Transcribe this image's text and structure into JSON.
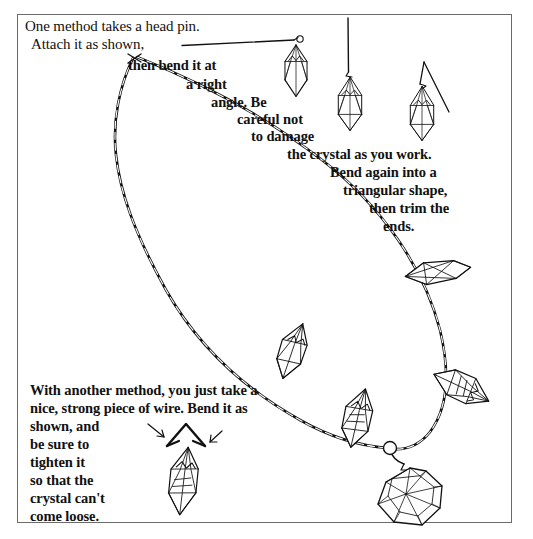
{
  "page": {
    "background_color": "#ffffff",
    "ink_color": "#111111",
    "frame_color": "#6b6b6b"
  },
  "frame": {
    "name": "illustration-border"
  },
  "instructions": {
    "top_block": {
      "full_text": "One method takes a head pin. Attach it as shown, then bend it at a right angle. Be careful not to damage the crystal as you work. Bend again into a triangular shape, then trim the ends.",
      "lines": [
        "One method takes a head pin.",
        "Attach it as shown,",
        "then bend it at",
        "a right",
        "angle. Be",
        "careful not",
        "to damage",
        "the crystal as you work.",
        "Bend again into a",
        "triangular shape,",
        "then trim the",
        "ends."
      ]
    },
    "bottom_block": {
      "full_text": "With another method, you just take a nice, strong piece of wire. Bend it as shown, and be sure to tighten it so that the crystal can't come loose.",
      "lines": [
        "With another method, you just take a",
        "nice, strong piece of wire. Bend it as",
        "shown, and",
        "be sure to",
        "tighten it",
        "so that the",
        "crystal can't",
        "come loose."
      ]
    }
  },
  "figures": {
    "head_pin_wire": {
      "label": "head-pin-straight-wire",
      "description": "Straight horizontal head pin wire with small loop at right end"
    },
    "crystal_step_1": {
      "label": "crystal-on-straight-head-pin",
      "description": "Faceted quartz crystal hanging from straight head pin"
    },
    "crystal_step_2": {
      "label": "crystal-right-angle-bend",
      "description": "Crystal with wire bent at a right angle, vertical wire above"
    },
    "crystal_step_3": {
      "label": "crystal-triangular-bail",
      "description": "Crystal with wire bent again into triangular shape, ends trimmed"
    },
    "wire_triangle_bail": {
      "label": "triangular-wire-bail-diagram",
      "description": "Bent wire triangle bail with two arrows indicating tightening direction"
    },
    "crystal_alt_method": {
      "label": "crystal-with-wire-bail",
      "description": "Crystal held by triangular wire bail, alternate method"
    },
    "necklace": {
      "label": "finished-crystal-necklace",
      "description": "Oval-link chain necklace with five wire-wrapped crystal pendants and one large faceted center drop",
      "pendant_count": 6
    }
  }
}
